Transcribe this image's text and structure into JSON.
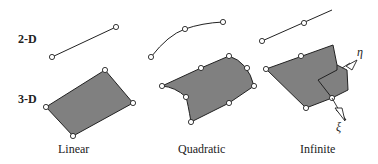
{
  "row_labels": {
    "two_d": "2-D",
    "three_d": "3-D"
  },
  "column_labels": {
    "linear": "Linear",
    "quadratic": "Quadratic",
    "infinite": "Infinite"
  },
  "axis_labels": {
    "eta": "η",
    "xi": "ξ"
  },
  "colors": {
    "fill": "#808080",
    "stroke": "#222222",
    "node": "#ffffff"
  }
}
